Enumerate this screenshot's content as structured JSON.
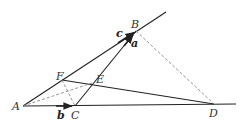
{
  "diagram": {
    "type": "geometry-vector",
    "points": {
      "A": {
        "label": "A",
        "x": 23,
        "y": 106
      },
      "B": {
        "label": "B",
        "x": 136,
        "y": 31
      },
      "C": {
        "label": "C",
        "x": 75,
        "y": 106
      },
      "D": {
        "label": "D",
        "x": 214,
        "y": 104
      },
      "E": {
        "label": "E",
        "x": 92,
        "y": 83
      },
      "F": {
        "label": "F",
        "x": 62,
        "y": 80
      }
    },
    "vectors": {
      "a": {
        "label": "a"
      },
      "b": {
        "label": "b"
      },
      "c": {
        "label": "c"
      }
    },
    "colors": {
      "line": "#222222",
      "dashed": "#888888",
      "label": "#333333"
    }
  }
}
